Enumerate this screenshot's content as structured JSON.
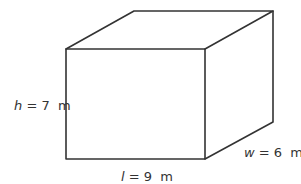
{
  "diagram": {
    "shape": "rectangular prism",
    "colors": {
      "stroke": "#333333",
      "background": "#ffffff"
    },
    "labels": {
      "height": {
        "var": "h",
        "eq": " = 7  m",
        "value": 7,
        "unit": "m"
      },
      "length": {
        "var": "l",
        "eq": " = 9  m",
        "value": 9,
        "unit": "m"
      },
      "width": {
        "var": "w",
        "eq": " = 6  m",
        "value": 6,
        "unit": "m"
      }
    }
  }
}
